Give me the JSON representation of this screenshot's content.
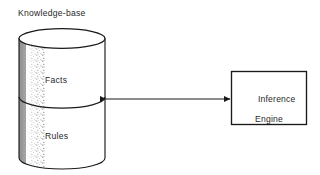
{
  "diagram": {
    "type": "expert-system-architecture",
    "background_color": "#ffffff",
    "stroke_color": "#1a1a1a",
    "nodes": {
      "knowledge_base": {
        "title": "Knowledge-base",
        "shape": "cylinder",
        "shaded_side": "left",
        "compartments": [
          {
            "label": "Facts"
          },
          {
            "label": "Rules"
          }
        ]
      },
      "inference_engine": {
        "shape": "rectangle",
        "label_line1": "Inference",
        "label_line2": "Engine"
      }
    },
    "connector": {
      "style": "double-headed-arrow",
      "from": "knowledge-base",
      "to": "inference-engine",
      "label": ""
    }
  }
}
